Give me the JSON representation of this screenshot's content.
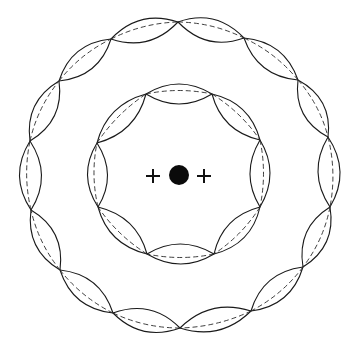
{
  "diagram": {
    "title": "",
    "colors": {
      "stroke": "#1a1a1a",
      "background": "#ffffff",
      "nucleus": "#0a0a0a"
    },
    "nucleus": {
      "cx": 179,
      "cy": 175,
      "r": 10
    },
    "charges": [
      {
        "symbol": "+",
        "cx": 153,
        "cy": 176,
        "size": 14
      },
      {
        "symbol": "+",
        "cx": 204,
        "cy": 176,
        "size": 14
      }
    ],
    "orbits": [
      {
        "name": "inner-orbit",
        "cx": 179,
        "cy": 175,
        "r": 83,
        "nodes": [
          [
            146,
            94
          ],
          [
            212,
            94
          ],
          [
            260,
            140
          ],
          [
            260,
            207
          ],
          [
            214,
            254
          ],
          [
            147,
            254
          ],
          [
            98,
            207
          ],
          [
            97,
            143
          ]
        ],
        "amplitude": 10
      },
      {
        "name": "outer-orbit",
        "cx": 180,
        "cy": 175,
        "r": 152,
        "nodes": [
          [
            178,
            22
          ],
          [
            244,
            38
          ],
          [
            298,
            80
          ],
          [
            328,
            137
          ],
          [
            330,
            207
          ],
          [
            303,
            267
          ],
          [
            251,
            311
          ],
          [
            180,
            328
          ],
          [
            113,
            313
          ],
          [
            60,
            270
          ],
          [
            31,
            210
          ],
          [
            30,
            141
          ],
          [
            59,
            81
          ],
          [
            111,
            39
          ]
        ],
        "amplitude": 11
      }
    ]
  }
}
